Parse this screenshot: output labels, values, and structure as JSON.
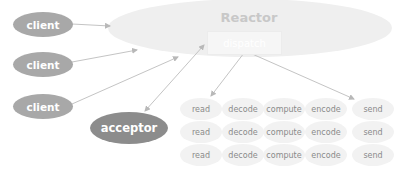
{
  "reactor": {
    "title": "Reactor",
    "dispatch_label": "dispatch"
  },
  "clients": [
    {
      "label": "client"
    },
    {
      "label": "client"
    },
    {
      "label": "client"
    }
  ],
  "acceptor": {
    "label": "acceptor"
  },
  "task_rows": [
    [
      "read",
      "decode",
      "compute",
      "encode",
      "send"
    ],
    [
      "read",
      "decode",
      "compute",
      "encode",
      "send"
    ],
    [
      "read",
      "decode",
      "compute",
      "encode",
      "send"
    ]
  ],
  "colors": {
    "client_fill": "#a8a8a8",
    "acceptor_fill": "#8c8c8c",
    "reactor_fill": "#efefef",
    "task_fill": "#f2f2f2",
    "arrow": "#c4c4c4"
  }
}
